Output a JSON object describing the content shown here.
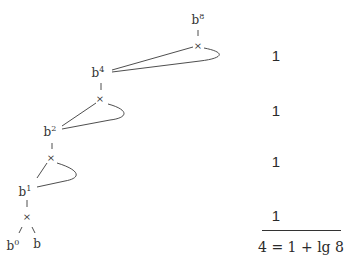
{
  "diagram": {
    "nodes": [
      {
        "id": "b8",
        "base": "b",
        "exp": "8",
        "x": 198,
        "y": 18
      },
      {
        "id": "b4",
        "base": "b",
        "exp": "4",
        "x": 98,
        "y": 71
      },
      {
        "id": "b2",
        "base": "b",
        "exp": "2",
        "x": 50,
        "y": 130
      },
      {
        "id": "b1",
        "base": "b",
        "exp": "1",
        "x": 25,
        "y": 190
      },
      {
        "id": "b0",
        "base": "b",
        "exp": "0",
        "x": 13,
        "y": 244
      },
      {
        "id": "b",
        "base": "b",
        "exp": "",
        "x": 37,
        "y": 244
      }
    ],
    "operators": [
      {
        "symbol": "×",
        "x": 198,
        "y": 46
      },
      {
        "symbol": "×",
        "x": 100,
        "y": 99
      },
      {
        "symbol": "×",
        "x": 51,
        "y": 158
      },
      {
        "symbol": "×",
        "x": 27,
        "y": 217
      }
    ],
    "costs": [
      "1",
      "1",
      "1",
      "1"
    ],
    "cost_positions": [
      {
        "x": 276,
        "y": 55
      },
      {
        "x": 276,
        "y": 110
      },
      {
        "x": 276,
        "y": 161
      },
      {
        "x": 276,
        "y": 215
      }
    ],
    "total": "4 = 1 + lg 8",
    "line_color": "#333333",
    "text_color": "#333333"
  }
}
